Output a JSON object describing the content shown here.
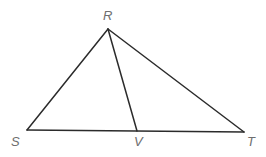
{
  "figure": {
    "type": "geometry-diagram",
    "background_color": "#ffffff",
    "line_color": "#2b2b2b",
    "label_color": "#6e6e6e",
    "line_width": 1.5,
    "canvas": {
      "width": 266,
      "height": 157
    },
    "points": {
      "R": {
        "label": "R",
        "x": 108,
        "y": 29,
        "label_x": 103,
        "label_y": 9
      },
      "S": {
        "label": "S",
        "x": 27,
        "y": 130,
        "label_x": 11,
        "label_y": 135
      },
      "V": {
        "label": "V",
        "x": 137,
        "y": 131,
        "label_x": 134,
        "label_y": 135
      },
      "T": {
        "label": "T",
        "x": 244,
        "y": 132,
        "label_x": 247,
        "label_y": 135
      }
    },
    "segments": [
      {
        "name": "RS",
        "from": "R",
        "to": "S"
      },
      {
        "name": "RT",
        "from": "R",
        "to": "T"
      },
      {
        "name": "ST",
        "from": "S",
        "to": "T"
      },
      {
        "name": "RV",
        "from": "R",
        "to": "V"
      }
    ]
  }
}
